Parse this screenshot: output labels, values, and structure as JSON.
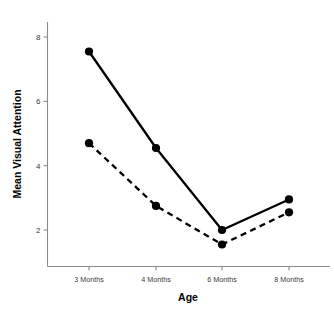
{
  "chart_data": {
    "type": "line",
    "title": "",
    "xlabel": "Age",
    "ylabel": "Mean Visual Attention",
    "categories": [
      "3 Months",
      "4 Months",
      "6 Months",
      "8 Months"
    ],
    "x_tick_labels": [
      "3 Months",
      "4 Months",
      "6 Months",
      "8 Months"
    ],
    "y_tick_labels": [
      "2",
      "4",
      "6",
      "8"
    ],
    "y_ticks": [
      2,
      4,
      6,
      8
    ],
    "ylim": [
      0.9,
      8.6
    ],
    "grid": false,
    "legend": "none",
    "series": [
      {
        "name": "solid-series",
        "line_style": "solid",
        "color": "#000000",
        "values": [
          7.55,
          4.55,
          2.0,
          2.95
        ]
      },
      {
        "name": "dashed-series",
        "line_style": "dashed",
        "color": "#000000",
        "values": [
          4.7,
          2.75,
          1.55,
          2.55
        ]
      }
    ]
  },
  "axes": {
    "y_axis_title": "Mean Visual Attention",
    "x_axis_title": "Age"
  },
  "colors": {
    "foreground": "#000000",
    "axis": "#8a8a8a",
    "background": "#ffffff",
    "tick_text": "#3a3a3a"
  }
}
